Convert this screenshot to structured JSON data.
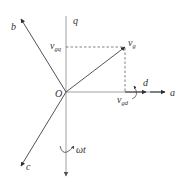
{
  "diagram": {
    "colors": {
      "axis_gray": "#a0a0a0",
      "vector_dark": "#404040",
      "text": "#333333",
      "background": "#ffffff"
    },
    "origin": {
      "label": "O"
    },
    "axes": {
      "q": {
        "label": "q"
      },
      "a": {
        "label": "a"
      },
      "b": {
        "label": "b"
      },
      "c": {
        "label": "c"
      },
      "d": {
        "label": "d"
      }
    },
    "vectors": {
      "vg": {
        "main": "v",
        "sub": "g"
      },
      "vgq": {
        "main": "v",
        "sub": "gq"
      },
      "vgd": {
        "main": "v",
        "sub": "gd"
      }
    },
    "rotation": {
      "label": "ωt"
    }
  }
}
